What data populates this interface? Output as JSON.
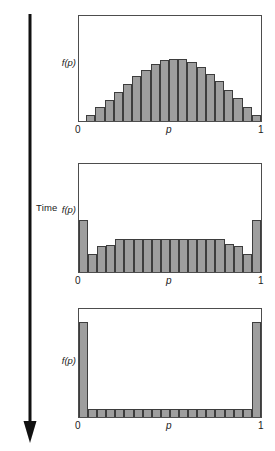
{
  "figure": {
    "background": "#ffffff",
    "bar_fill": "#9e9e9e",
    "bar_stroke": "#3d3d3d",
    "frame_color": "#4d4d4d"
  },
  "time_axis": {
    "label": "Time",
    "direction": "downward",
    "arrow_icon": "down-arrow-icon"
  },
  "axes_labels": {
    "ylabel": "f(p)",
    "xlabel": "p",
    "xtick_left": "0",
    "xtick_right": "1"
  },
  "chart_data": [
    {
      "type": "bar",
      "title": "",
      "panel": "top",
      "xlabel": "p",
      "ylabel": "f(p)",
      "xlim": [
        0,
        1
      ],
      "ylim": [
        0,
        1
      ],
      "grid": false,
      "legend": null,
      "xtick_labels": [
        "0",
        "1"
      ],
      "categories": [
        "0.025",
        "0.075",
        "0.125",
        "0.175",
        "0.225",
        "0.275",
        "0.325",
        "0.375",
        "0.425",
        "0.475",
        "0.525",
        "0.575",
        "0.625",
        "0.675",
        "0.725",
        "0.775",
        "0.825",
        "0.875",
        "0.925",
        "0.975"
      ],
      "values": [
        0.0,
        0.06,
        0.13,
        0.2,
        0.28,
        0.35,
        0.43,
        0.49,
        0.54,
        0.58,
        0.59,
        0.59,
        0.56,
        0.51,
        0.45,
        0.38,
        0.3,
        0.22,
        0.13,
        0.06
      ]
    },
    {
      "type": "bar",
      "title": "",
      "panel": "middle",
      "xlabel": "p",
      "ylabel": "f(p)",
      "xlim": [
        0,
        1
      ],
      "ylim": [
        0,
        1
      ],
      "grid": false,
      "legend": null,
      "xtick_labels": [
        "0",
        "1"
      ],
      "categories": [
        "0.025",
        "0.075",
        "0.125",
        "0.175",
        "0.225",
        "0.275",
        "0.325",
        "0.375",
        "0.425",
        "0.475",
        "0.525",
        "0.575",
        "0.625",
        "0.675",
        "0.725",
        "0.775",
        "0.825",
        "0.875",
        "0.925",
        "0.975"
      ],
      "values": [
        0.48,
        0.17,
        0.24,
        0.25,
        0.31,
        0.31,
        0.31,
        0.31,
        0.31,
        0.31,
        0.31,
        0.31,
        0.31,
        0.31,
        0.31,
        0.31,
        0.26,
        0.24,
        0.17,
        0.48
      ]
    },
    {
      "type": "bar",
      "title": "",
      "panel": "bottom",
      "xlabel": "p",
      "ylabel": "f(p)",
      "xlim": [
        0,
        1
      ],
      "ylim": [
        0,
        1
      ],
      "grid": false,
      "legend": null,
      "xtick_labels": [
        "0",
        "1"
      ],
      "categories": [
        "0.025",
        "0.075",
        "0.125",
        "0.175",
        "0.225",
        "0.275",
        "0.325",
        "0.375",
        "0.425",
        "0.475",
        "0.525",
        "0.575",
        "0.625",
        "0.675",
        "0.725",
        "0.775",
        "0.825",
        "0.875",
        "0.925",
        "0.975"
      ],
      "values": [
        0.88,
        0.07,
        0.07,
        0.07,
        0.07,
        0.07,
        0.07,
        0.07,
        0.07,
        0.07,
        0.07,
        0.07,
        0.07,
        0.07,
        0.07,
        0.07,
        0.07,
        0.07,
        0.07,
        0.88
      ]
    }
  ]
}
